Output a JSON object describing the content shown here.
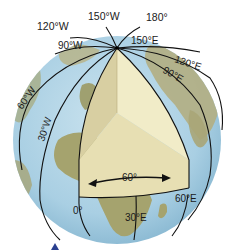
{
  "figure": {
    "colors": {
      "ocean": "#a9cfe3",
      "land": "#a8a57a",
      "meridian": "#111111",
      "wedge_face_left": "#d8cfa2",
      "wedge_face_right": "#f1ecc8",
      "wedge_face_bottom": "#e7dfb3",
      "marker": "#2a3f8f"
    }
  },
  "labels": {
    "lon_150w": "150°W",
    "lon_180": "180°",
    "lon_120w": "120°W",
    "lon_90w": "90°W",
    "lon_150e": "150°E",
    "lon_120e": "120°E",
    "lon_90e": "90°E",
    "lon_60w": "60°W",
    "lon_30w": "30°W",
    "lon_0": "0°",
    "lon_30e": "30°E",
    "lon_60e": "60°E",
    "angle": "60°"
  }
}
